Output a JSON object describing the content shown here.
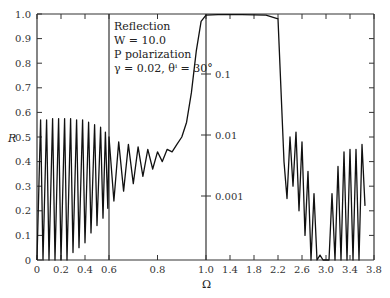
{
  "chart_data": {
    "type": "line",
    "title": "",
    "annotation": [
      "Reflection",
      "W = 10.0",
      "P polarization",
      "γ = 0.02, θⁱ = 30°"
    ],
    "xlabel": "Ω",
    "ylabel": "R",
    "x_ticks": [
      "0",
      "0.2",
      "0.4",
      "0.6",
      "0.8",
      "1.0",
      "1.4",
      "1.8",
      "2.2",
      "2.6",
      "3.0",
      "3.4",
      "3.8"
    ],
    "y_ticks": [
      "0",
      "0.1",
      "0.2",
      "0.3",
      "0.4",
      "0.5",
      "0.6",
      "0.7",
      "0.8",
      "0.9",
      "1.0"
    ],
    "inner_log_ticks": [
      "0.1",
      "0.01",
      "0.001"
    ],
    "ylim": [
      0,
      1.0
    ],
    "xlim": [
      0,
      3.8
    ],
    "grid": false,
    "axis_breaks": {
      "panel_dividers_at": [
        0.6,
        1.0
      ]
    },
    "series": [
      {
        "name": "R(Ω)",
        "x": [
          0.0,
          0.03,
          0.05,
          0.08,
          0.1,
          0.13,
          0.15,
          0.18,
          0.2,
          0.23,
          0.25,
          0.28,
          0.3,
          0.33,
          0.35,
          0.38,
          0.4,
          0.43,
          0.45,
          0.48,
          0.5,
          0.53,
          0.55,
          0.57,
          0.59,
          0.6,
          0.62,
          0.64,
          0.66,
          0.68,
          0.7,
          0.72,
          0.74,
          0.76,
          0.78,
          0.8,
          0.82,
          0.84,
          0.86,
          0.88,
          0.9,
          0.92,
          0.94,
          0.96,
          0.98,
          1.0,
          1.2,
          1.6,
          2.0,
          2.2,
          2.3,
          2.35,
          2.4,
          2.45,
          2.5,
          2.55,
          2.6,
          2.65,
          2.7,
          2.75,
          2.8,
          2.85,
          2.9,
          2.95,
          3.0,
          3.05,
          3.1,
          3.15,
          3.2,
          3.25,
          3.3,
          3.35,
          3.4,
          3.45,
          3.5,
          3.55,
          3.6,
          3.65
        ],
        "y": [
          0.0,
          0.57,
          0.0,
          0.57,
          0.0,
          0.575,
          0.0,
          0.575,
          0.0,
          0.575,
          0.0,
          0.575,
          0.03,
          0.57,
          0.05,
          0.57,
          0.07,
          0.56,
          0.11,
          0.55,
          0.14,
          0.54,
          0.17,
          0.52,
          0.21,
          0.5,
          0.24,
          0.48,
          0.28,
          0.47,
          0.31,
          0.46,
          0.34,
          0.45,
          0.37,
          0.44,
          0.4,
          0.45,
          0.44,
          0.47,
          0.5,
          0.56,
          0.68,
          0.85,
          0.97,
          0.995,
          0.997,
          0.997,
          0.995,
          0.98,
          0.4,
          0.25,
          0.5,
          0.3,
          0.52,
          0.2,
          0.48,
          0.1,
          0.36,
          0.0,
          0.27,
          0.0,
          0.02,
          0.0,
          0.0,
          0.0,
          0.27,
          0.0,
          0.38,
          0.0,
          0.44,
          0.0,
          0.45,
          0.0,
          0.45,
          0.0,
          0.47,
          0.22
        ]
      }
    ]
  }
}
